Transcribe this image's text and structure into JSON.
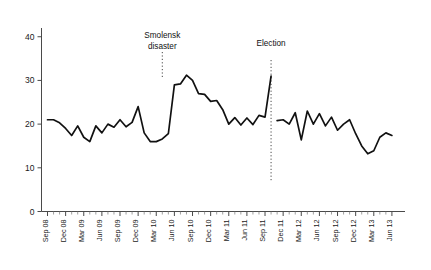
{
  "chart_data": {
    "type": "line",
    "title": "",
    "subtitle": "",
    "xlabel": "",
    "ylabel": "",
    "ylim": [
      0,
      42
    ],
    "yticks": [
      0,
      10,
      20,
      30,
      40
    ],
    "ytick_labels": [
      "0",
      "10",
      "20",
      "30",
      "40"
    ],
    "grid": false,
    "legend": null,
    "xtick_labels": [
      "Sep 08",
      "Dec 08",
      "Mar 09",
      "Jun 09",
      "Sep 09",
      "Dec 09",
      "Mar 10",
      "Jun 10",
      "Sep 10",
      "Dec 10",
      "Mar 11",
      "Jun 11",
      "Sep 11",
      "Dec 11",
      "Mar 12",
      "Jun 12",
      "Sep 12",
      "Dec 12",
      "Mar 13",
      "Jun 13"
    ],
    "x_start": "Sep 08",
    "x_end": "Jun 13",
    "x_interval": "monthly",
    "x_label_interval": "quarterly",
    "annotations": [
      {
        "name": "smolensk-disaster",
        "label_line1": "Smolensk",
        "label_line2": "disaster",
        "at_x": "Apr 10",
        "style": "dotted-vertical"
      },
      {
        "name": "election",
        "label_line1": "Election",
        "label_line2": "",
        "at_x": "Oct 11",
        "style": "dotted-vertical"
      }
    ],
    "series": [
      {
        "name": "support",
        "color": "#111111",
        "break_at_x": "Oct 11",
        "x": [
          "Sep 08",
          "Oct 08",
          "Nov 08",
          "Dec 08",
          "Jan 09",
          "Feb 09",
          "Mar 09",
          "Apr 09",
          "May 09",
          "Jun 09",
          "Jul 09",
          "Aug 09",
          "Sep 09",
          "Oct 09",
          "Nov 09",
          "Dec 09",
          "Jan 10",
          "Feb 10",
          "Mar 10",
          "Apr 10",
          "May 10",
          "Jun 10",
          "Jul 10",
          "Aug 10",
          "Sep 10",
          "Oct 10",
          "Nov 10",
          "Dec 10",
          "Jan 11",
          "Feb 11",
          "Mar 11",
          "Apr 11",
          "May 11",
          "Jun 11",
          "Jul 11",
          "Aug 11",
          "Sep 11",
          "Oct 11",
          "Nov 11",
          "Dec 11",
          "Jan 12",
          "Feb 12",
          "Mar 12",
          "Apr 12",
          "May 12",
          "Jun 12",
          "Jul 12",
          "Aug 12",
          "Sep 12",
          "Oct 12",
          "Nov 12",
          "Dec 12",
          "Jan 13",
          "Feb 13",
          "Mar 13",
          "Apr 13",
          "May 13",
          "Jun 13"
        ],
        "values": [
          21.0,
          21.0,
          20.3,
          19.0,
          17.4,
          19.6,
          17.0,
          16.0,
          19.6,
          18.0,
          20.0,
          19.3,
          21.0,
          19.4,
          20.4,
          24.0,
          18.0,
          16.0,
          16.0,
          16.6,
          17.8,
          29.0,
          29.2,
          31.2,
          30.0,
          27.0,
          26.8,
          25.2,
          25.4,
          23.3,
          20.0,
          21.5,
          19.8,
          21.4,
          19.9,
          22.0,
          21.6,
          31.0,
          20.8,
          21.0,
          20.0,
          22.6,
          16.4,
          23.0,
          20.0,
          22.4,
          19.6,
          21.6,
          18.6,
          20.0,
          21.0,
          17.8,
          15.0,
          13.2,
          13.9,
          17.0,
          18.0,
          17.4
        ]
      }
    ]
  },
  "axes": {
    "y_axis_name": "value-axis",
    "x_axis_name": "time-axis"
  }
}
